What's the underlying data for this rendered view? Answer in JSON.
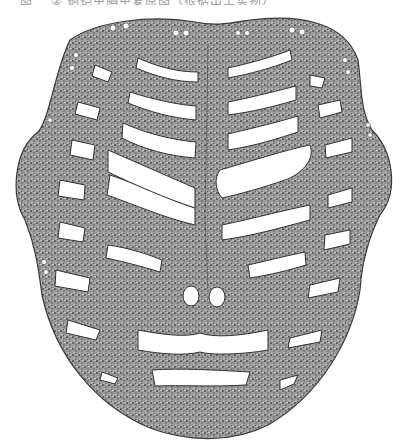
{
  "caption": {
    "text": "图一  ②  铜铠甲胸甲复原图（根据出土实物）",
    "color": "#9a9a9a"
  },
  "figure": {
    "fill_color": "#8c8c8c",
    "stipple_color": "#5a5a5a",
    "outline_color": "#3a3a3a",
    "slot_color": "#ffffff"
  }
}
